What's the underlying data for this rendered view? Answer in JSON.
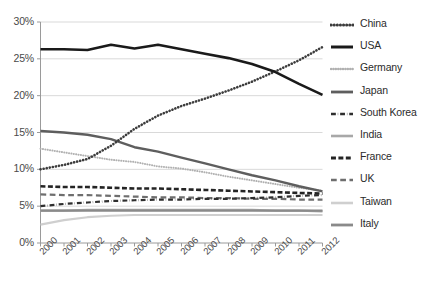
{
  "chart_data": {
    "type": "line",
    "title": "",
    "xlabel": "",
    "ylabel": "",
    "x": [
      2000,
      2001,
      2002,
      2003,
      2004,
      2005,
      2006,
      2007,
      2008,
      2009,
      2010,
      2011,
      2012
    ],
    "categories": [
      "2000",
      "2001",
      "2002",
      "2003",
      "2004",
      "2005",
      "2006",
      "2007",
      "2008",
      "2009",
      "2010",
      "2011",
      "2012"
    ],
    "xlim": [
      2000,
      2012
    ],
    "ylim": [
      0,
      30
    ],
    "yticks": [
      0,
      5,
      10,
      15,
      20,
      25,
      30
    ],
    "ytick_labels": [
      "0%",
      "5%",
      "10%",
      "15%",
      "20%",
      "25%",
      "30%"
    ],
    "grid": "horizontal",
    "legend_position": "right",
    "value_unit": "%",
    "series": [
      {
        "name": "China",
        "style": "dotted",
        "color": "#3c3c3c",
        "width": 2.6,
        "values": [
          10.0,
          10.6,
          11.4,
          13.2,
          15.5,
          17.3,
          18.6,
          19.6,
          20.7,
          21.9,
          23.3,
          24.8,
          26.6
        ]
      },
      {
        "name": "USA",
        "style": "solid",
        "color": "#1a1a1a",
        "width": 2.6,
        "values": [
          26.3,
          26.3,
          26.2,
          26.9,
          26.4,
          26.9,
          26.3,
          25.7,
          25.1,
          24.3,
          23.2,
          21.6,
          20.1
        ]
      },
      {
        "name": "Germany",
        "style": "dotted",
        "color": "#b0b0b0",
        "width": 2.0,
        "values": [
          12.8,
          12.3,
          11.8,
          11.3,
          11.0,
          10.4,
          10.1,
          9.6,
          9.0,
          8.5,
          8.0,
          7.5,
          7.1
        ]
      },
      {
        "name": "Japan",
        "style": "solid",
        "color": "#5e5e5e",
        "width": 2.4,
        "values": [
          15.2,
          15.0,
          14.7,
          14.1,
          13.0,
          12.4,
          11.6,
          10.8,
          10.0,
          9.2,
          8.5,
          7.7,
          7.0
        ]
      },
      {
        "name": "South Korea",
        "style": "dashdot",
        "color": "#2e2e2e",
        "width": 2.2,
        "values": [
          5.0,
          5.3,
          5.5,
          5.7,
          5.8,
          5.9,
          5.9,
          6.0,
          6.0,
          6.1,
          6.2,
          6.4,
          6.5
        ]
      },
      {
        "name": "India",
        "style": "solid",
        "color": "#a8a8a8",
        "width": 2.2,
        "values": [
          4.4,
          4.4,
          4.5,
          4.5,
          4.5,
          4.5,
          4.5,
          4.5,
          4.5,
          4.5,
          4.4,
          4.4,
          4.3
        ]
      },
      {
        "name": "France",
        "style": "dashed",
        "color": "#242424",
        "width": 2.6,
        "values": [
          7.7,
          7.6,
          7.6,
          7.5,
          7.4,
          7.4,
          7.3,
          7.2,
          7.1,
          7.0,
          6.9,
          6.8,
          6.7
        ]
      },
      {
        "name": "UK",
        "style": "dashed-long",
        "color": "#6e6e6e",
        "width": 2.2,
        "values": [
          6.6,
          6.5,
          6.5,
          6.4,
          6.3,
          6.2,
          6.2,
          6.1,
          6.1,
          6.0,
          6.0,
          5.9,
          5.9
        ]
      },
      {
        "name": "Taiwan",
        "style": "solid",
        "color": "#cfcfcf",
        "width": 2.2,
        "values": [
          2.5,
          3.1,
          3.5,
          3.7,
          3.8,
          3.8,
          3.8,
          3.8,
          3.8,
          3.8,
          3.8,
          3.8,
          3.8
        ]
      },
      {
        "name": "Italy",
        "style": "solid",
        "color": "#8a8a8a",
        "width": 2.4,
        "values": [
          4.4,
          4.4,
          4.4,
          4.4,
          4.4,
          4.4,
          4.4,
          4.4,
          4.4,
          4.4,
          4.4,
          4.4,
          4.4
        ]
      }
    ]
  },
  "legend": {
    "items": [
      {
        "label": "China"
      },
      {
        "label": "USA"
      },
      {
        "label": "Germany"
      },
      {
        "label": "Japan"
      },
      {
        "label": "South Korea"
      },
      {
        "label": "India"
      },
      {
        "label": "France"
      },
      {
        "label": "UK"
      },
      {
        "label": "Taiwan"
      },
      {
        "label": "Italy"
      }
    ]
  },
  "axes": {
    "y_tick_labels": [
      "30%",
      "25%",
      "20%",
      "15%",
      "10%",
      "5%",
      "0%"
    ],
    "x_tick_labels": [
      "2000",
      "2001",
      "2002",
      "2003",
      "2004",
      "2005",
      "2006",
      "2007",
      "2008",
      "2009",
      "2010",
      "2011",
      "2012"
    ]
  },
  "colors": {
    "axis": "#9a9a9a",
    "grid": "#d9d9d9",
    "text": "#4a4a4a"
  }
}
